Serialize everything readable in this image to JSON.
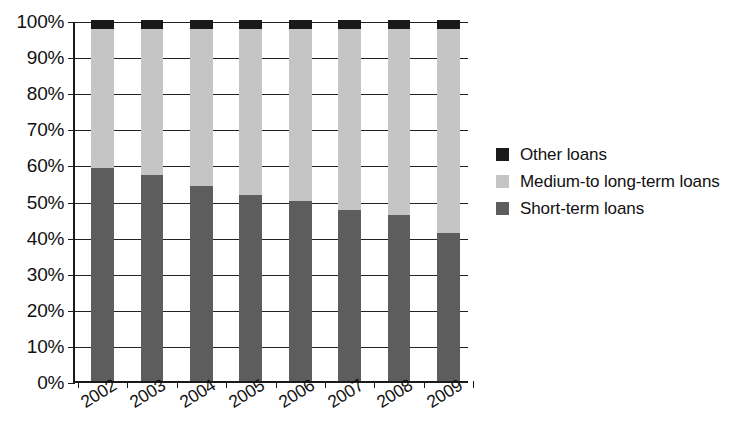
{
  "chart_data": {
    "type": "bar",
    "variant": "stacked-percent",
    "title": "",
    "subtitle": "",
    "xlabel": "",
    "ylabel": "",
    "categories": [
      "2002",
      "2003",
      "2004",
      "2005",
      "2006",
      "2007",
      "2008",
      "2009"
    ],
    "series": [
      {
        "name": "Short-term loans",
        "color": "#5d5d5d",
        "values": [
          59,
          57,
          54,
          51.5,
          50,
          47.5,
          46,
          41
        ]
      },
      {
        "name": "Medium-to long-term loans",
        "color": "#c5c5c5",
        "values": [
          38.5,
          40.5,
          43.5,
          46,
          47.5,
          50,
          51.5,
          56.5
        ]
      },
      {
        "name": "Other loans",
        "color": "#1a1a1a",
        "values": [
          2.5,
          2.5,
          2.5,
          2.5,
          2.5,
          2.5,
          2.5,
          2.5
        ]
      }
    ],
    "ylim": [
      0,
      100
    ],
    "ytick_labels": [
      "0%",
      "10%",
      "20%",
      "30%",
      "40%",
      "50%",
      "60%",
      "70%",
      "80%",
      "90%",
      "100%"
    ],
    "ytick_values": [
      0,
      10,
      20,
      30,
      40,
      50,
      60,
      70,
      80,
      90,
      100
    ],
    "grid": true,
    "grid_axis": "y",
    "legend_position": "right",
    "legend_order": [
      "Other loans",
      "Medium-to long-term loans",
      "Short-term loans"
    ],
    "xtick_label_rotation": -32
  },
  "legend": {
    "items": [
      {
        "label": "Other loans",
        "color": "#1a1a1a"
      },
      {
        "label": "Medium-to long-term loans",
        "color": "#c5c5c5"
      },
      {
        "label": "Short-term loans",
        "color": "#5d5d5d"
      }
    ]
  },
  "colors": {
    "axis": "#1a1a1a",
    "grid": "#222222",
    "background": "#ffffff",
    "text": "#111111"
  }
}
